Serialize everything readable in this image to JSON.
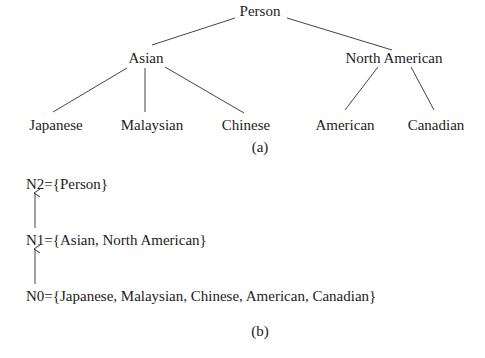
{
  "tree": {
    "root": "Person",
    "level1": [
      "Asian",
      "North American"
    ],
    "leaves": [
      "Japanese",
      "Malaysian",
      "Chinese",
      "American",
      "Canadian"
    ],
    "edges": [
      [
        "Person",
        "Asian"
      ],
      [
        "Person",
        "North American"
      ],
      [
        "Asian",
        "Japanese"
      ],
      [
        "Asian",
        "Malaysian"
      ],
      [
        "Asian",
        "Chinese"
      ],
      [
        "North American",
        "American"
      ],
      [
        "North American",
        "Canadian"
      ]
    ],
    "caption": "(a)"
  },
  "levels": {
    "n2": "N2={Person}",
    "n1": "N1={Asian, North American}",
    "n0": "N0={Japanese, Malaysian, Chinese, American, Canadian}",
    "caption": "(b)"
  },
  "colors": {
    "text": "#222222",
    "line": "#444444",
    "background": "#ffffff"
  }
}
